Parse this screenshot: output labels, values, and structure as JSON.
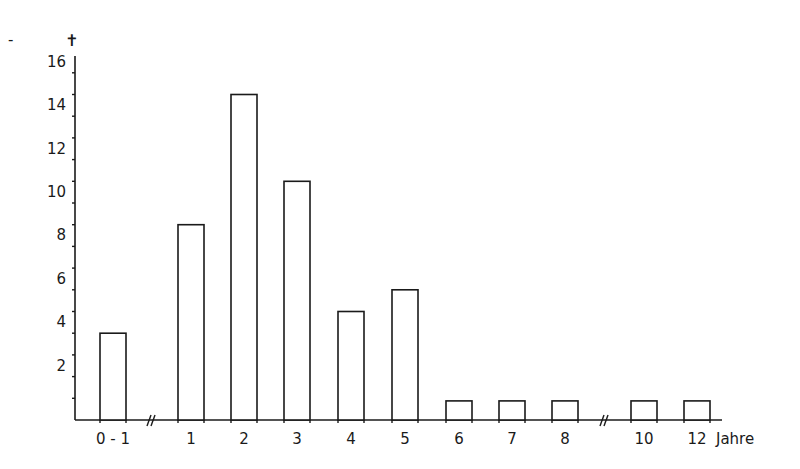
{
  "chart_data": {
    "type": "bar",
    "title": "",
    "ylabel_symbol": "✝",
    "ylabel": "Todesfälle (Anzahl)",
    "xlabel": "Jahre",
    "categories": [
      "0 - 1",
      "1",
      "2",
      "3",
      "4",
      "5",
      "6",
      "7",
      "8",
      "10",
      "12"
    ],
    "values": [
      4,
      9,
      15,
      11,
      5,
      6,
      1,
      1,
      1,
      1,
      1
    ],
    "ylim": [
      0,
      16
    ],
    "yticks_labeled": [
      2,
      4,
      6,
      8,
      10,
      12,
      14,
      16
    ],
    "yticks_minor_step": 1,
    "axis_breaks_after": [
      "0 - 1",
      "8"
    ],
    "grid": false,
    "legend": "none"
  },
  "stray_mark": "-"
}
